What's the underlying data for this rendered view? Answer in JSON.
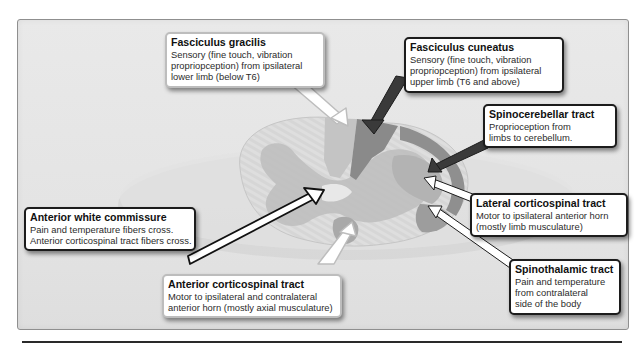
{
  "diagram": {
    "colors": {
      "frame_bg": "#e6e6e6",
      "cord_white_matter": "#d2d2d2",
      "gray_matter": "#bdbdbd",
      "fasciculus_gracilis": "#c4c4c4",
      "fasciculus_cuneatus": "#8a8a8a",
      "spinocerebellar": "#8f8f8f",
      "lateral_corticospinal": "#b3b3b3",
      "spinothalamic": "#9d9d9d",
      "anterior_corticospinal": "#a9a9a9"
    },
    "callouts": [
      {
        "id": "fasciculus-gracilis",
        "title": "Fasciculus gracilis",
        "lines": [
          "Sensory (fine touch, vibration",
          "propriopception) from ipsilateral",
          "lower limb (below T6)"
        ]
      },
      {
        "id": "fasciculus-cuneatus",
        "title": "Fasciculus cuneatus",
        "lines": [
          "Sensory (fine touch, vibration",
          "propriopception) from ipsilateral",
          "upper limb (T6 and above)"
        ]
      },
      {
        "id": "spinocerebellar-tract",
        "title": "Spinocerebellar tract",
        "lines": [
          "Proprioception from",
          "limbs to cerebellum."
        ]
      },
      {
        "id": "lateral-corticospinal-tract",
        "title": "Lateral corticospinal tract",
        "lines": [
          "Motor to ipsilateral anterior horn",
          "(mostly limb musculature)"
        ]
      },
      {
        "id": "spinothalamic-tract",
        "title": "Spinothalamic tract",
        "lines": [
          "Pain and temperature",
          "from contralateral",
          "side of the body"
        ]
      },
      {
        "id": "anterior-corticospinal-tract",
        "title": "Anterior corticospinal tract",
        "lines": [
          "Motor to ipsilateral and contralateral",
          "anterior horn (mostly axial musculature)"
        ]
      },
      {
        "id": "anterior-white-commissure",
        "title": "Anterior white commissure",
        "lines": [
          "Pain and temperature fibers cross.",
          "Anterior corticospinal tract fibers cross."
        ]
      }
    ]
  }
}
